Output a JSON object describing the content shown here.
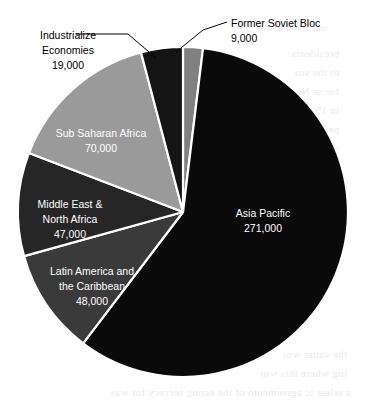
{
  "chart_data": {
    "type": "pie",
    "title": "",
    "subtitle": "",
    "xlabel": "",
    "ylabel": "",
    "legend_position": "none",
    "grid": false,
    "total": 464000,
    "units": "",
    "categories": [
      "Former Soviet Bloc",
      "Asia Pacific",
      "Latin America and the Caribbean",
      "Middle East & North Africa",
      "Sub Saharan Africa",
      "Industrialize Economies"
    ],
    "values": [
      9000,
      271000,
      48000,
      47000,
      70000,
      19000
    ],
    "value_labels": [
      "9,000",
      "271,000",
      "48,000",
      "47,000",
      "70,000",
      "19,000"
    ],
    "start_angle_deg": 0,
    "direction": "clockwise",
    "slices": [
      {
        "name": "Former Soviet Bloc",
        "label_line1": "Former Soviet Bloc",
        "label_line2": "9,000",
        "value": 9000,
        "value_label": "9,000",
        "percent": 1.9,
        "color": "#808080",
        "label_placement": "outside",
        "label_x": 231,
        "label_y": 27,
        "label_y2": 42,
        "label_anchor": "start",
        "leader_path": "M 227 22 L 203 30 L 176 52"
      },
      {
        "name": "Asia Pacific",
        "label_line1": "Asia Pacific",
        "label_line2": "271,000",
        "value": 271000,
        "value_label": "271,000",
        "percent": 58.4,
        "color": "#0a0a0a",
        "label_placement": "inside",
        "label_x": 263,
        "label_y": 217,
        "label_y2": 232,
        "label_anchor": "middle",
        "leader_path": ""
      },
      {
        "name": "Latin America and the Caribbean",
        "label_line1": "Latin America and",
        "label_line2": "the Caribbean",
        "label_line3": "48,000",
        "value": 48000,
        "value_label": "48,000",
        "percent": 10.3,
        "color": "#3a3a3a",
        "label_placement": "inside",
        "label_x": 92,
        "label_y": 275,
        "label_y2": 290,
        "label_y3": 305,
        "label_anchor": "middle",
        "leader_path": ""
      },
      {
        "name": "Middle East & North Africa",
        "label_line1": "Middle East &",
        "label_line2": "North Africa",
        "label_line3": "47,000",
        "value": 47000,
        "value_label": "47,000",
        "percent": 10.1,
        "color": "#262626",
        "label_placement": "inside",
        "label_x": 70,
        "label_y": 208,
        "label_y2": 223,
        "label_y3": 238,
        "label_anchor": "middle",
        "leader_path": ""
      },
      {
        "name": "Sub Saharan Africa",
        "label_line1": "Sub Saharan Africa",
        "label_line2": "70,000",
        "value": 70000,
        "value_label": "70,000",
        "percent": 15.1,
        "color": "#9a9a9a",
        "label_placement": "inside",
        "label_x": 101,
        "label_y": 137,
        "label_y2": 152,
        "label_anchor": "middle",
        "leader_path": ""
      },
      {
        "name": "Industrialize Economies",
        "label_line1": "Industrialize",
        "label_line2": "Economies",
        "label_line3": "19,000",
        "value": 19000,
        "value_label": "19,000",
        "percent": 4.1,
        "color": "#141414",
        "label_placement": "outside",
        "label_x": 68,
        "label_y": 39,
        "label_y2": 54,
        "label_y3": 69,
        "label_anchor": "middle",
        "leader_path": "M 76 34 L 128 34 L 156 58"
      }
    ],
    "geometry": {
      "center_x": 183,
      "center_y": 212,
      "radius": 165,
      "separator_color": "#ffffff",
      "separator_width": 2.2
    },
    "background_color": "#ffffff"
  },
  "bleed_text": {
    "lines": [
      "out lived of ter",
      "presidents",
      "to the sus",
      "for se Ne",
      "in 19 tor",
      "per ce of",
      "se our st",
      "as of the",
      "un in a we",
      "the sulter wor",
      "ing where this wor",
      "a selest ic agreemento of the esting secrecy for was"
    ],
    "positions": [
      {
        "x": 40,
        "y": 18
      },
      {
        "x": 28,
        "y": 44
      },
      {
        "x": 28,
        "y": 63
      },
      {
        "x": 28,
        "y": 82
      },
      {
        "x": 28,
        "y": 101
      },
      {
        "x": 28,
        "y": 120
      },
      {
        "x": 28,
        "y": 139
      },
      {
        "x": 28,
        "y": 158
      },
      {
        "x": 28,
        "y": 177
      },
      {
        "x": 20,
        "y": 345
      },
      {
        "x": 20,
        "y": 364
      },
      {
        "x": 16,
        "y": 383
      }
    ]
  }
}
